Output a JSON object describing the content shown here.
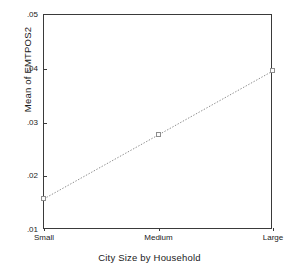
{
  "chart_data": {
    "type": "line",
    "title": "",
    "subtitle": "",
    "xlabel": "City Size by Household",
    "ylabel": "Mean of EMTPOS2",
    "categories": [
      "Small",
      "Medium",
      "Large"
    ],
    "values": [
      0.0158,
      0.0277,
      0.0396
    ],
    "series": [
      {
        "name": "Mean of EMTPOS2",
        "values": [
          0.0158,
          0.0277,
          0.0396
        ]
      }
    ],
    "ylim": [
      0.01,
      0.05
    ],
    "yticks": [
      ".05",
      ".04",
      ".03",
      ".02",
      ".01"
    ],
    "ytick_values": [
      0.05,
      0.04,
      0.03,
      0.02,
      0.01
    ],
    "xtick_labels": [
      "Small",
      "Medium",
      "Large"
    ],
    "grid": false,
    "legend": "none",
    "line_style": "dotted",
    "marker_style": "open-square",
    "colors": {
      "line": "#8d8d8d",
      "marker_edge": "#8d8d8d",
      "marker_fill": "#fcfcfc",
      "axis": "#3a3a3a",
      "text": "#1a1a1a",
      "background": "#ffffff"
    }
  },
  "axes": {
    "y": {
      "label": "Mean of EMTPOS2",
      "ticks": [
        {
          "label": ".05",
          "value": 0.05
        },
        {
          "label": ".04",
          "value": 0.04
        },
        {
          "label": ".03",
          "value": 0.03
        },
        {
          "label": ".02",
          "value": 0.02
        },
        {
          "label": ".01",
          "value": 0.01
        }
      ]
    },
    "x": {
      "label": "City Size by Household",
      "ticks": [
        {
          "label": "Small"
        },
        {
          "label": "Medium"
        },
        {
          "label": "Large"
        }
      ]
    }
  }
}
